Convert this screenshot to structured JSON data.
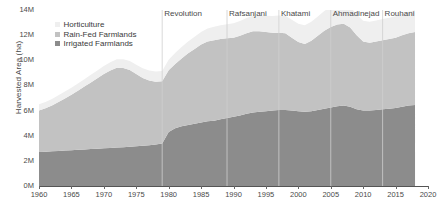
{
  "chart_data": {
    "type": "area",
    "stacked": true,
    "title": "",
    "xlabel": "",
    "ylabel": "Harvested Area (ha)",
    "xlim": [
      1960,
      2020
    ],
    "ylim": [
      0,
      14000000
    ],
    "ytick_labels": [
      "0M",
      "2M",
      "4M",
      "6M",
      "8M",
      "10M",
      "12M",
      "14M"
    ],
    "ytick_values": [
      0,
      2000000,
      4000000,
      6000000,
      8000000,
      10000000,
      12000000,
      14000000
    ],
    "xtick_labels": [
      "1960",
      "1965",
      "1970",
      "1975",
      "1980",
      "1985",
      "1990",
      "1995",
      "2000",
      "2005",
      "2010",
      "2015",
      "2020"
    ],
    "xtick_values": [
      1960,
      1965,
      1970,
      1975,
      1980,
      1985,
      1990,
      1995,
      2000,
      2005,
      2010,
      2015,
      2020
    ],
    "grid": false,
    "legend_position": "top-left",
    "x": [
      1960,
      1961,
      1962,
      1963,
      1964,
      1965,
      1966,
      1967,
      1968,
      1969,
      1970,
      1971,
      1972,
      1973,
      1974,
      1975,
      1976,
      1977,
      1978,
      1979,
      1980,
      1981,
      1982,
      1983,
      1984,
      1985,
      1986,
      1987,
      1988,
      1989,
      1990,
      1991,
      1992,
      1993,
      1994,
      1995,
      1996,
      1997,
      1998,
      1999,
      2000,
      2001,
      2002,
      2003,
      2004,
      2005,
      2006,
      2007,
      2008,
      2009,
      2010,
      2011,
      2012,
      2013,
      2014,
      2015,
      2016,
      2017,
      2018
    ],
    "series": [
      {
        "name": "Irrigated Farmlands",
        "color": "#8c8c8c",
        "values": [
          2700000,
          2730000,
          2760000,
          2790000,
          2820000,
          2850000,
          2880000,
          2910000,
          2940000,
          2970000,
          3000000,
          3030000,
          3060000,
          3090000,
          3120000,
          3160000,
          3200000,
          3250000,
          3300000,
          3380000,
          4300000,
          4600000,
          4750000,
          4850000,
          4950000,
          5050000,
          5150000,
          5200000,
          5300000,
          5400000,
          5500000,
          5600000,
          5750000,
          5850000,
          5900000,
          5950000,
          6000000,
          6050000,
          6050000,
          6000000,
          5950000,
          5900000,
          5950000,
          6050000,
          6150000,
          6250000,
          6350000,
          6400000,
          6300000,
          6100000,
          6000000,
          6000000,
          6050000,
          6100000,
          6150000,
          6200000,
          6300000,
          6400000,
          6450000
        ]
      },
      {
        "name": "Rain-Fed Farmlands",
        "color": "#c2c2c2",
        "values": [
          3300000,
          3450000,
          3650000,
          3900000,
          4150000,
          4400000,
          4700000,
          5000000,
          5300000,
          5600000,
          5900000,
          6150000,
          6350000,
          6300000,
          6100000,
          5750000,
          5400000,
          5150000,
          5000000,
          4950000,
          4900000,
          5100000,
          5400000,
          5700000,
          5950000,
          6200000,
          6350000,
          6400000,
          6400000,
          6350000,
          6300000,
          6350000,
          6400000,
          6450000,
          6400000,
          6300000,
          6200000,
          6150000,
          6100000,
          5800000,
          5500000,
          5400000,
          5600000,
          5900000,
          6200000,
          6400000,
          6500000,
          6500000,
          6300000,
          5900000,
          5500000,
          5400000,
          5450000,
          5500000,
          5550000,
          5600000,
          5700000,
          5750000,
          5800000
        ]
      },
      {
        "name": "Horticulture",
        "color": "#efefef",
        "values": [
          500000,
          510000,
          520000,
          530000,
          545000,
          560000,
          575000,
          590000,
          605000,
          620000,
          640000,
          660000,
          680000,
          700000,
          720000,
          740000,
          760000,
          780000,
          800000,
          820000,
          850000,
          880000,
          910000,
          940000,
          970000,
          1000000,
          1030000,
          1060000,
          1090000,
          1120000,
          1150000,
          1180000,
          1210000,
          1240000,
          1270000,
          1300000,
          1330000,
          1360000,
          1390000,
          1420000,
          1450000,
          1480000,
          1510000,
          1540000,
          1570000,
          1600000,
          1620000,
          1640000,
          1650000,
          1650000,
          1650000,
          1660000,
          1670000,
          1680000,
          1690000,
          1700000,
          1710000,
          1720000,
          1730000
        ]
      }
    ],
    "annotations": [
      {
        "label": "Revolution",
        "year": 1979
      },
      {
        "label": "Rafsanjani",
        "year": 1989
      },
      {
        "label": "Khatami",
        "year": 1997
      },
      {
        "label": "Ahmadinejad",
        "year": 2005
      },
      {
        "label": "Rouhani",
        "year": 2013
      }
    ],
    "annotation_line_color": "#cfcfcf"
  },
  "legend": {
    "items": [
      {
        "label": "Horticulture",
        "color": "#efefef"
      },
      {
        "label": "Rain-Fed Farmlands",
        "color": "#c2c2c2"
      },
      {
        "label": "Irrigated Farmlands",
        "color": "#8c8c8c"
      }
    ]
  }
}
